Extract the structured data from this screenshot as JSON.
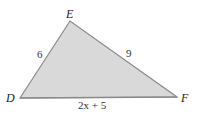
{
  "diagram": {
    "type": "triangle",
    "fill_color": "#d9d9d9",
    "stroke_color": "#8a8a8a",
    "vertices": [
      {
        "name": "D",
        "x": 20,
        "y": 98
      },
      {
        "name": "E",
        "x": 70,
        "y": 21
      },
      {
        "name": "F",
        "x": 177,
        "y": 97
      }
    ],
    "vertex_labels": {
      "D": "D",
      "E": "E",
      "F": "F"
    },
    "side_labels": {
      "DE": "6",
      "EF": "9",
      "DF": "2x + 5"
    }
  }
}
